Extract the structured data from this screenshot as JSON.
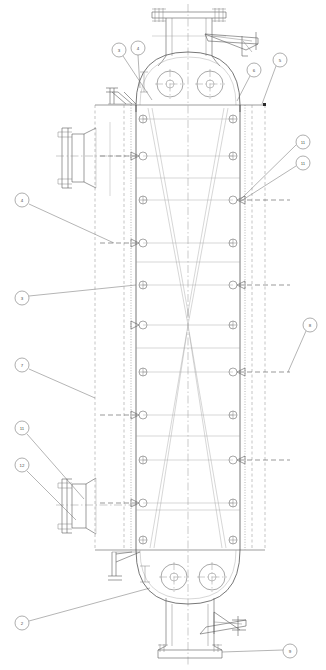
{
  "drawing": {
    "type": "vertical-pressure-vessel-elevation",
    "title": "Vertical Pressure Vessel Elevation",
    "canvas": {
      "width": 326,
      "height": 670
    },
    "background": "#ffffff",
    "line_color": "#5a5a5a",
    "accent_color": "#4a4a4a"
  },
  "geometry": {
    "center_x": 188,
    "shell_left_x": 136,
    "shell_right_x": 240,
    "outer_left_x": 95,
    "outer_right_x": 265,
    "top_tangent_y": 105,
    "bottom_tangent_y": 550,
    "head_top_y": 52,
    "head_bottom_y": 604,
    "waist_y": 325
  },
  "balloons": [
    {
      "id": "b1",
      "label": "3",
      "cx": 119,
      "cy": 50,
      "r": 7,
      "lead_to_x": 152,
      "lead_to_y": 100
    },
    {
      "id": "b2",
      "label": "4",
      "cx": 138,
      "cy": 48,
      "r": 7,
      "lead_to_x": 140,
      "lead_to_y": 88
    },
    {
      "id": "b3",
      "label": "6",
      "cx": 254,
      "cy": 70,
      "r": 7,
      "lead_to_x": 237,
      "lead_to_y": 101
    },
    {
      "id": "b4",
      "label": "5",
      "cx": 280,
      "cy": 60,
      "r": 7,
      "lead_to_x": 262,
      "lead_to_y": 104
    },
    {
      "id": "b5",
      "label": "11",
      "cx": 303,
      "cy": 142,
      "r": 7,
      "lead_to_x": 240,
      "lead_to_y": 200
    },
    {
      "id": "b6",
      "label": "11",
      "cx": 303,
      "cy": 163,
      "r": 7,
      "lead_to_x": 240,
      "lead_to_y": 200
    },
    {
      "id": "b7",
      "label": "4",
      "cx": 22,
      "cy": 200,
      "r": 7,
      "lead_to_x": 114,
      "lead_to_y": 243
    },
    {
      "id": "b8",
      "label": "3",
      "cx": 22,
      "cy": 298,
      "r": 7,
      "lead_to_x": 136,
      "lead_to_y": 285
    },
    {
      "id": "b9",
      "label": "8",
      "cx": 310,
      "cy": 325,
      "r": 7,
      "lead_to_x": 288,
      "lead_to_y": 372
    },
    {
      "id": "b10",
      "label": "7",
      "cx": 22,
      "cy": 365,
      "r": 7,
      "lead_to_x": 95,
      "lead_to_y": 398
    },
    {
      "id": "b11",
      "label": "11",
      "cx": 22,
      "cy": 428,
      "r": 7,
      "lead_to_x": 80,
      "lead_to_y": 500
    },
    {
      "id": "b12",
      "label": "12",
      "cx": 22,
      "cy": 465,
      "r": 7,
      "lead_to_x": 72,
      "lead_to_y": 505
    },
    {
      "id": "b13",
      "label": "2",
      "cx": 22,
      "cy": 623,
      "r": 7,
      "lead_to_x": 150,
      "lead_to_y": 588
    },
    {
      "id": "b14",
      "label": "9",
      "cx": 290,
      "cy": 651,
      "r": 7,
      "lead_to_x": 226,
      "lead_to_y": 641
    }
  ],
  "shell_nozzles_left": [
    {
      "y": 119,
      "arrow": false
    },
    {
      "y": 156,
      "arrow": true
    },
    {
      "y": 200,
      "arrow": false
    },
    {
      "y": 243,
      "arrow": true
    },
    {
      "y": 285,
      "arrow": false
    },
    {
      "y": 325,
      "arrow": true
    },
    {
      "y": 372,
      "arrow": false
    },
    {
      "y": 415,
      "arrow": true
    },
    {
      "y": 460,
      "arrow": false
    },
    {
      "y": 503,
      "arrow": true
    },
    {
      "y": 540,
      "arrow": false
    }
  ],
  "shell_nozzles_right": [
    {
      "y": 119,
      "arrow": false
    },
    {
      "y": 156,
      "arrow": false
    },
    {
      "y": 200,
      "arrow": true
    },
    {
      "y": 243,
      "arrow": false
    },
    {
      "y": 285,
      "arrow": true
    },
    {
      "y": 325,
      "arrow": false
    },
    {
      "y": 372,
      "arrow": true
    },
    {
      "y": 415,
      "arrow": false
    },
    {
      "y": 460,
      "arrow": true
    },
    {
      "y": 503,
      "arrow": false
    },
    {
      "y": 540,
      "arrow": false
    }
  ],
  "dimension_dashes": [
    {
      "y": 156,
      "x1": 100,
      "x2": 136
    },
    {
      "y": 243,
      "x1": 100,
      "x2": 136
    },
    {
      "y": 325,
      "x1": 240,
      "x2": 290
    },
    {
      "y": 200,
      "x1": 240,
      "x2": 290
    },
    {
      "y": 372,
      "x1": 240,
      "x2": 290
    },
    {
      "y": 460,
      "x1": 240,
      "x2": 290
    },
    {
      "y": 503,
      "x1": 100,
      "x2": 136
    },
    {
      "y": 415,
      "x1": 100,
      "x2": 136
    }
  ],
  "head_manways": {
    "top": [
      {
        "cx": 170,
        "cy": 84,
        "r": 13
      },
      {
        "cx": 210,
        "cy": 84,
        "r": 13
      }
    ],
    "bottom": [
      {
        "cx": 174,
        "cy": 577,
        "r": 13
      },
      {
        "cx": 212,
        "cy": 577,
        "r": 13
      }
    ]
  },
  "nozzle_top": {
    "name": "top-nozzle",
    "neck_left_x": 166,
    "neck_right_x": 212,
    "flange_y": 12,
    "neck_bottom_y": 62
  },
  "nozzle_bottom": {
    "name": "bottom-nozzle",
    "neck_left_x": 166,
    "neck_right_x": 214,
    "flange_y": 655,
    "neck_top_y": 600
  },
  "nozzle_left_upper": {
    "name": "left-upper-nozzle",
    "cy": 156,
    "flange_x": 62,
    "neck_x": 96
  },
  "nozzle_left_lower": {
    "name": "left-lower-nozzle",
    "cy": 505,
    "flange_x": 58,
    "neck_x": 96
  },
  "platforms": [
    {
      "name": "top-davit-bracket",
      "x": 205,
      "y": 30
    },
    {
      "name": "bottom-davit-bracket",
      "x": 200,
      "y": 620
    }
  ],
  "supports": [
    {
      "name": "upper-support-clip",
      "x": 108,
      "y": 88
    },
    {
      "name": "lower-support-clip",
      "x": 112,
      "y": 556
    }
  ],
  "internal_trays": {
    "description": "converging diagonal internals forming an X at the vessel waist",
    "left_top_x": 148,
    "right_top_x": 228,
    "waist_x": 188,
    "waist_y": 325,
    "left_bottom_x": 150,
    "right_bottom_x": 226
  }
}
